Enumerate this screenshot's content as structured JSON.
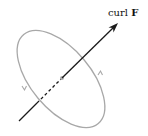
{
  "diagram": {
    "label": {
      "prefix": "curl ",
      "symbol": "F"
    },
    "colors": {
      "loop": "#a8a8a8",
      "axis": "#1a1a1a",
      "center_dot": "#b0b0b0",
      "background": "#ffffff"
    },
    "elements": [
      "tilted-elliptical-loop",
      "curl-vector-arrow",
      "loop-direction-arrows",
      "center-point"
    ]
  }
}
